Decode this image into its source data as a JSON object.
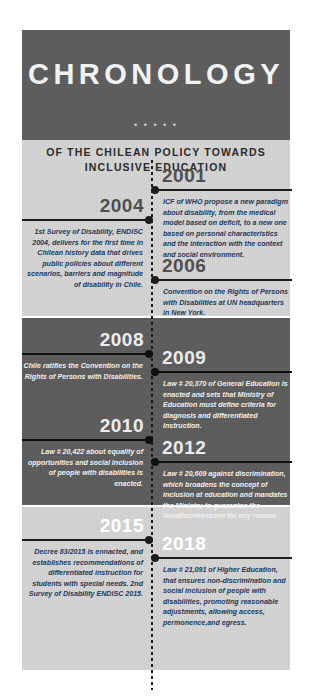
{
  "header": {
    "title": "CHRONOLOGY",
    "dots": "• • • • •",
    "subtitle_line1": "OF THE CHILEAN POLICY TOWARDS",
    "subtitle_line2": "INCLUSIVE EDUCATION"
  },
  "colors": {
    "band_dark": "#5b5b5b",
    "band_light": "#d4d4d4",
    "title_text": "#f2f2f2",
    "text_dark": "#23395b",
    "text_light": "#f0f0f0",
    "rule": "#1c1c1c"
  },
  "chart_data": {
    "type": "timeline",
    "title": "CHRONOLOGY",
    "subtitle": "OF THE CHILEAN POLICY TOWARDS INCLUSIVE EDUCATION",
    "orientation": "vertical",
    "axis_style": "dotted-center-spine",
    "range": [
      2001,
      2018
    ],
    "events": [
      {
        "year": "2001",
        "side": "right",
        "band": "light",
        "text": "ICF of WHO propose a new paradigm about disability, from the medical model based on deficit, to a new one based on personal characteristics and the interaction with the context and social environment."
      },
      {
        "year": "2004",
        "side": "left",
        "band": "light",
        "text": "1st Survey of Disability, ENDISC 2004, delivers for the first time in Chilean history data that drives public policies about different scenarios, barriers and magnitude of disability in Chile."
      },
      {
        "year": "2006",
        "side": "right",
        "band": "light",
        "text": "Convention on the Rights of Persons with Disabilities at UN headquarters in New York."
      },
      {
        "year": "2008",
        "side": "left",
        "band": "dark",
        "text": "Chile ratifies the  Convention on the Rights of Persons with Disabilities."
      },
      {
        "year": "2009",
        "side": "right",
        "band": "dark",
        "text": "Law # 20,370 of General Education is enacted and sets that Ministry of Education must define criteria for diagnosis and differentiated instruction."
      },
      {
        "year": "2010",
        "side": "left",
        "band": "dark",
        "text": "Law # 20,422 about equality of opportunities and social inclusion of people with disabilities is enacted."
      },
      {
        "year": "2012",
        "side": "right",
        "band": "dark",
        "text": "Law #  20,609 against discrimination, which broadens the concept of inclusion at education and mandates the Ministry to guarantee the Nondiscrimination for any reason."
      },
      {
        "year": "2015",
        "side": "left",
        "band": "light",
        "text": "Decree 83/2015 is ennacted, and establishes recommendations of differentiated instruction for students with special needs. 2nd Survey of Disability ENDISC 2015."
      },
      {
        "year": "2018",
        "side": "right",
        "band": "light",
        "text": "Law # 21,091 of Higher Education, that ensures non-discrimination and social inclusion of people with disabilities, promoting reasonable adjustments, allowing access, permonence,and egress."
      }
    ]
  }
}
